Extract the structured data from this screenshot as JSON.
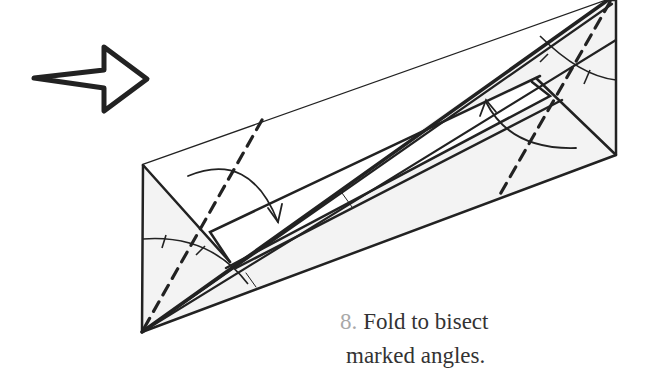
{
  "step": {
    "number": "8.",
    "instruction_line1": "Fold to bisect",
    "instruction_line2": "marked angles."
  },
  "diagram": {
    "paper_fill": "#f3f3f3",
    "line_color": "#222222",
    "step_number_color": "#a8a8a8",
    "text_color": "#333333",
    "symbols": [
      "turn-over-arrow-icon",
      "valley-fold-dashed-lines",
      "fold-direction-arrows",
      "angle-bisector-arc-marks"
    ]
  }
}
